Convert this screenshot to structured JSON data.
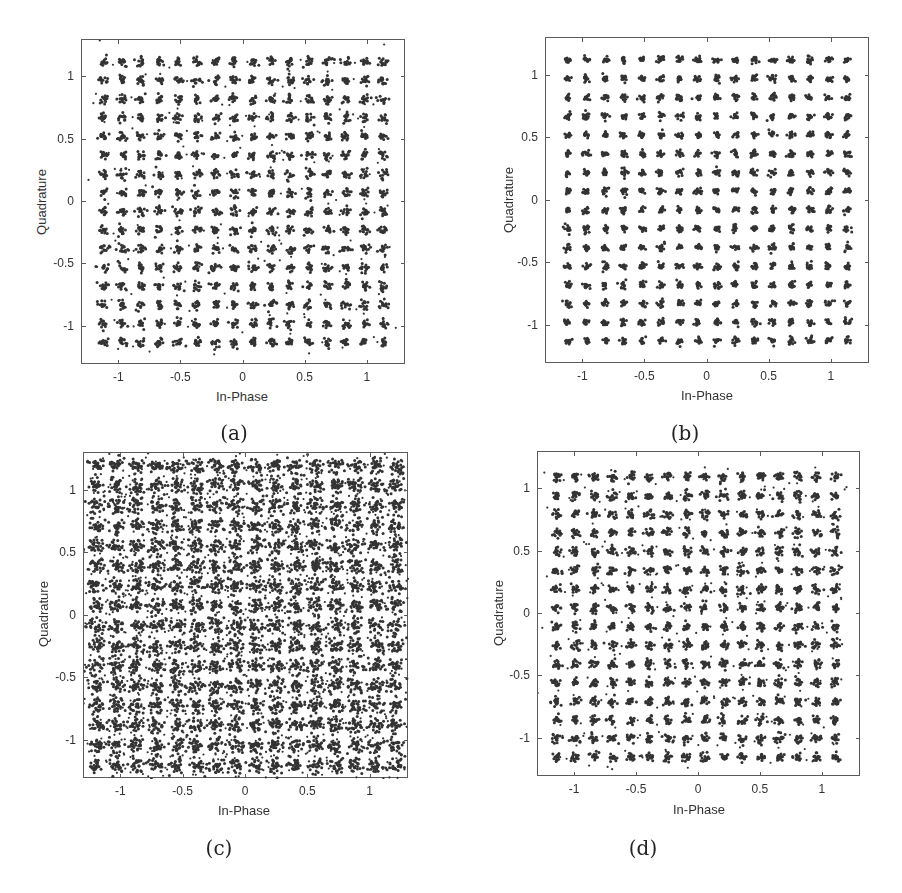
{
  "figure": {
    "panels": [
      {
        "id": "a",
        "caption": "(a)",
        "xlabel": "In-Phase",
        "ylabel": "Quadrature"
      },
      {
        "id": "b",
        "caption": "(b)",
        "xlabel": "In-Phase",
        "ylabel": "Quadrature"
      },
      {
        "id": "c",
        "caption": "(c)",
        "xlabel": "In-Phase",
        "ylabel": "Quadrature"
      },
      {
        "id": "d",
        "caption": "(d)",
        "xlabel": "In-Phase",
        "ylabel": "Quadrature"
      }
    ]
  },
  "chart_data": [
    {
      "type": "scatter",
      "title": "",
      "caption": "(a)",
      "xlabel": "In-Phase",
      "ylabel": "Quadrature",
      "xlim": [
        -1.3,
        1.3
      ],
      "ylim": [
        -1.3,
        1.3
      ],
      "xticks": [
        -1,
        -0.5,
        0,
        0.5,
        1
      ],
      "xtick_labels": [
        "-1",
        "-0.5",
        "0",
        "0.5",
        "1"
      ],
      "yticks": [
        -1,
        -0.5,
        0,
        0.5,
        1
      ],
      "ytick_labels": [
        "-1",
        "-0.5",
        "0",
        "0.5",
        "1"
      ],
      "grid": false,
      "legend": null,
      "constellation": "256-QAM",
      "levels": [
        -1.125,
        -0.975,
        -0.825,
        -0.675,
        -0.525,
        -0.375,
        -0.225,
        -0.075,
        0.075,
        0.225,
        0.375,
        0.525,
        0.675,
        0.825,
        0.975,
        1.125
      ],
      "cluster_spread": 0.018,
      "outlier_fraction": 0.06,
      "points_per_cluster": 14,
      "marker_color": "#333333"
    },
    {
      "type": "scatter",
      "title": "",
      "caption": "(b)",
      "xlabel": "In-Phase",
      "ylabel": "Quadrature",
      "xlim": [
        -1.3,
        1.3
      ],
      "ylim": [
        -1.3,
        1.3
      ],
      "xticks": [
        -1,
        -0.5,
        0,
        0.5,
        1
      ],
      "xtick_labels": [
        "-1",
        "-0.5",
        "0",
        "0.5",
        "1"
      ],
      "yticks": [
        -1,
        -0.5,
        0,
        0.5,
        1
      ],
      "ytick_labels": [
        "-1",
        "-0.5",
        "0",
        "0.5",
        "1"
      ],
      "grid": false,
      "legend": null,
      "constellation": "256-QAM",
      "levels": [
        -1.125,
        -0.975,
        -0.825,
        -0.675,
        -0.525,
        -0.375,
        -0.225,
        -0.075,
        0.075,
        0.225,
        0.375,
        0.525,
        0.675,
        0.825,
        0.975,
        1.125
      ],
      "cluster_spread": 0.014,
      "outlier_fraction": 0.02,
      "points_per_cluster": 14,
      "marker_color": "#333333"
    },
    {
      "type": "scatter",
      "title": "",
      "caption": "(c)",
      "xlabel": "In-Phase",
      "ylabel": "Quadrature",
      "xlim": [
        -1.3,
        1.3
      ],
      "ylim": [
        -1.3,
        1.3
      ],
      "xticks": [
        -1,
        -0.5,
        0,
        0.5,
        1
      ],
      "xtick_labels": [
        "-1",
        "-0.5",
        "0",
        "0.5",
        "1"
      ],
      "yticks": [
        -1,
        -0.5,
        0,
        0.5,
        1
      ],
      "ytick_labels": [
        "-1",
        "-0.5",
        "0",
        "0.5",
        "1"
      ],
      "grid": false,
      "legend": null,
      "constellation": "256-QAM",
      "levels": [
        -1.2,
        -1.04,
        -0.88,
        -0.72,
        -0.56,
        -0.4,
        -0.24,
        -0.08,
        0.08,
        0.24,
        0.4,
        0.56,
        0.72,
        0.88,
        1.04,
        1.2
      ],
      "cluster_spread": 0.032,
      "outlier_fraction": 0.22,
      "points_per_cluster": 26,
      "marker_color": "#333333"
    },
    {
      "type": "scatter",
      "title": "",
      "caption": "(d)",
      "xlabel": "In-Phase",
      "ylabel": "Quadrature",
      "xlim": [
        -1.3,
        1.3
      ],
      "ylim": [
        -1.3,
        1.3
      ],
      "xticks": [
        -1,
        -0.5,
        0,
        0.5,
        1
      ],
      "xtick_labels": [
        "-1",
        "-0.5",
        "0",
        "0.5",
        "1"
      ],
      "yticks": [
        -1,
        -0.5,
        0,
        0.5,
        1
      ],
      "ytick_labels": [
        "-1",
        "-0.5",
        "0",
        "0.5",
        "1"
      ],
      "grid": false,
      "legend": null,
      "constellation": "256-QAM",
      "levels": [
        -1.15,
        -1.0,
        -0.85,
        -0.7,
        -0.55,
        -0.4,
        -0.25,
        -0.1,
        0.05,
        0.2,
        0.35,
        0.5,
        0.65,
        0.8,
        0.95,
        1.1
      ],
      "cluster_spread": 0.018,
      "outlier_fraction": 0.08,
      "points_per_cluster": 16,
      "marker_color": "#333333"
    }
  ]
}
